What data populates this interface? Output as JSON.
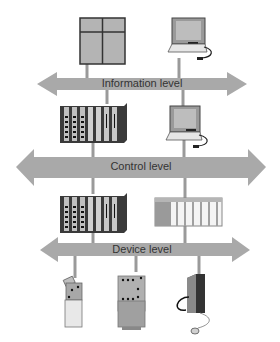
{
  "diagram": {
    "levels": [
      {
        "id": "information",
        "label": "Information level"
      },
      {
        "id": "control",
        "label": "Control level"
      },
      {
        "id": "device",
        "label": "Device level"
      }
    ],
    "nodes": [
      {
        "id": "server-cabinet",
        "level": "information",
        "type": "cabinet"
      },
      {
        "id": "workstation-top",
        "level": "information",
        "type": "computer"
      },
      {
        "id": "plc-rack-1",
        "level": "information-control",
        "type": "modular-plc"
      },
      {
        "id": "workstation-mid",
        "level": "information-control",
        "type": "computer"
      },
      {
        "id": "plc-rack-2",
        "level": "control-device",
        "type": "modular-plc"
      },
      {
        "id": "compact-plc",
        "level": "control-device",
        "type": "compact-plc"
      },
      {
        "id": "limit-switch",
        "level": "device",
        "type": "sensor"
      },
      {
        "id": "contactor",
        "level": "device",
        "type": "actuator"
      },
      {
        "id": "drive-unit",
        "level": "device",
        "type": "drive"
      }
    ],
    "colors": {
      "arrow": "#a9a9a9",
      "line": "#9a9a9a",
      "device_dark": "#3a3a3a",
      "device_mid": "#8c8c8c",
      "device_light": "#cfcfcf"
    }
  }
}
